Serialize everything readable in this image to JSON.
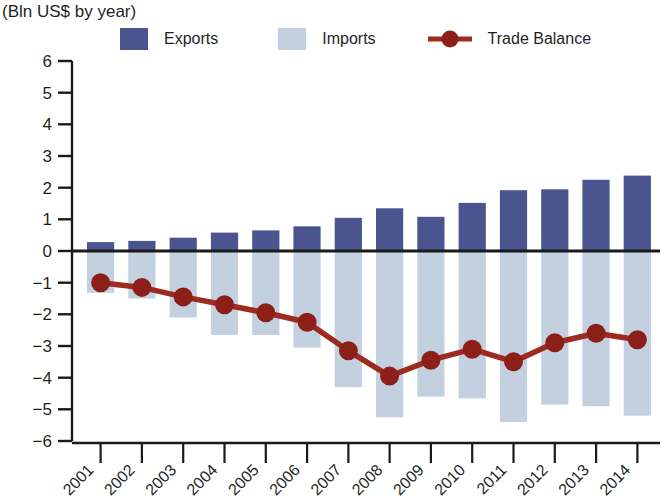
{
  "header": {
    "title_cut": "",
    "subtitle": "(Bln US$ by year)"
  },
  "legend": {
    "exports_label": "Exports",
    "imports_label": "Imports",
    "balance_label": "Trade Balance"
  },
  "colors": {
    "exports": "#4a5590",
    "imports": "#c3d0e0",
    "balance": "#9e2b20",
    "balance_marker": "#8c2018",
    "axis": "#1a1a1a",
    "background": "#ffffff"
  },
  "chart_data": {
    "type": "bar",
    "title": "(Bln US$ by year)",
    "xlabel": "",
    "ylabel": "",
    "ylim": [
      -6,
      6
    ],
    "yticks": [
      6,
      5,
      4,
      3,
      2,
      1,
      0,
      -1,
      -2,
      -3,
      -4,
      -5,
      -6
    ],
    "ytick_labels": [
      "6",
      "5",
      "4",
      "3",
      "2",
      "1",
      "0",
      "−1",
      "−2",
      "−3",
      "−4",
      "−5",
      "−6"
    ],
    "grid": false,
    "legend_position": "top",
    "categories": [
      "2001",
      "2002",
      "2003",
      "2004",
      "2005",
      "2006",
      "2007",
      "2008",
      "2009",
      "2010",
      "2011",
      "2012",
      "2013",
      "2014"
    ],
    "series": [
      {
        "name": "Exports",
        "type": "bar",
        "color": "#4a5590",
        "values": [
          0.28,
          0.32,
          0.42,
          0.58,
          0.65,
          0.78,
          1.05,
          1.35,
          1.08,
          1.52,
          1.92,
          1.95,
          2.25,
          2.38
        ]
      },
      {
        "name": "Imports",
        "type": "bar",
        "color": "#c3d0e0",
        "values": [
          -1.32,
          -1.5,
          -2.1,
          -2.65,
          -2.65,
          -3.05,
          -4.3,
          -5.25,
          -4.6,
          -4.65,
          -5.4,
          -4.85,
          -4.9,
          -5.2
        ]
      },
      {
        "name": "Trade Balance",
        "type": "line",
        "color": "#9e2b20",
        "values": [
          -1.0,
          -1.15,
          -1.45,
          -1.7,
          -1.95,
          -2.25,
          -3.15,
          -3.95,
          -3.45,
          -3.1,
          -3.5,
          -2.9,
          -2.6,
          -2.8
        ]
      }
    ]
  }
}
